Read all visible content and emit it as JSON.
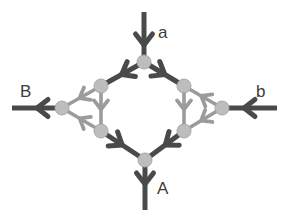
{
  "diagram": {
    "canvas": {
      "width": 286,
      "height": 220,
      "background": "#ffffff"
    },
    "colors": {
      "edge_dark": "#4a4a4a",
      "edge_light": "#9b9b9b",
      "node_fill": "#bdbdbd",
      "node_stroke": "#a8a8a8",
      "label_text": "#3c3c3c"
    },
    "labels": [
      {
        "id": "label-a",
        "text": "a",
        "x": 158,
        "y": 24,
        "role": "input-top"
      },
      {
        "id": "label-b",
        "text": "b",
        "x": 256,
        "y": 83,
        "role": "input-right"
      },
      {
        "id": "label-B",
        "text": "B",
        "x": 20,
        "y": 83,
        "role": "output-left"
      },
      {
        "id": "label-A",
        "text": "A",
        "x": 157,
        "y": 180,
        "role": "output-bottom"
      }
    ],
    "nodes": [
      {
        "id": "n-top",
        "x": 144,
        "y": 62,
        "r": 7
      },
      {
        "id": "n-upper-left",
        "x": 101,
        "y": 86,
        "r": 7
      },
      {
        "id": "n-upper-right",
        "x": 184,
        "y": 86,
        "r": 7
      },
      {
        "id": "n-left",
        "x": 62,
        "y": 108,
        "r": 7
      },
      {
        "id": "n-right",
        "x": 222,
        "y": 108,
        "r": 7
      },
      {
        "id": "n-lower-left",
        "x": 101,
        "y": 131,
        "r": 7
      },
      {
        "id": "n-lower-right",
        "x": 184,
        "y": 131,
        "r": 7
      },
      {
        "id": "n-bottom",
        "x": 145,
        "y": 160,
        "r": 7
      }
    ],
    "edges": [
      {
        "id": "e-in-a",
        "from": "external-top",
        "to": "n-top",
        "x1": 144,
        "y1": 12,
        "x2": 144,
        "y2": 62,
        "shade": "dark",
        "arrow_at": 0.66
      },
      {
        "id": "e-out-A",
        "from": "n-bottom",
        "to": "external-bot",
        "x1": 145,
        "y1": 160,
        "x2": 145,
        "y2": 210,
        "shade": "dark",
        "arrow_at": 0.48
      },
      {
        "id": "e-out-B",
        "from": "n-left",
        "to": "external-lft",
        "x1": 62,
        "y1": 108,
        "x2": 12,
        "y2": 108,
        "shade": "dark",
        "arrow_at": 0.5
      },
      {
        "id": "e-in-b",
        "from": "external-rgt",
        "to": "n-right",
        "x1": 277,
        "y1": 108,
        "x2": 222,
        "y2": 108,
        "shade": "dark",
        "arrow_at": 0.6
      },
      {
        "id": "e-top-ul",
        "from": "n-top",
        "to": "n-upper-left",
        "x1": 144,
        "y1": 62,
        "x2": 101,
        "y2": 86,
        "shade": "dark",
        "arrow_at": 0.52
      },
      {
        "id": "e-top-ur",
        "from": "n-top",
        "to": "n-upper-right",
        "x1": 144,
        "y1": 62,
        "x2": 184,
        "y2": 86,
        "shade": "dark",
        "arrow_at": 0.52
      },
      {
        "id": "e-ll-bot",
        "from": "n-lower-left",
        "to": "n-bottom",
        "x1": 101,
        "y1": 131,
        "x2": 145,
        "y2": 160,
        "shade": "dark",
        "arrow_at": 0.48
      },
      {
        "id": "e-lr-bot",
        "from": "n-lower-right",
        "to": "n-bottom",
        "x1": 184,
        "y1": 131,
        "x2": 145,
        "y2": 160,
        "shade": "dark",
        "arrow_at": 0.48
      },
      {
        "id": "e-ul-ll",
        "from": "n-upper-left",
        "to": "n-lower-left",
        "x1": 101,
        "y1": 86,
        "x2": 101,
        "y2": 131,
        "shade": "light",
        "arrow_at": 0.52
      },
      {
        "id": "e-ur-lr",
        "from": "n-upper-right",
        "to": "n-lower-right",
        "x1": 184,
        "y1": 86,
        "x2": 184,
        "y2": 131,
        "shade": "light",
        "arrow_at": 0.52
      },
      {
        "id": "e-ul-left",
        "from": "n-upper-left",
        "to": "n-left",
        "x1": 101,
        "y1": 86,
        "x2": 62,
        "y2": 108,
        "shade": "light",
        "arrow_at": 0.55
      },
      {
        "id": "e-ll-left",
        "from": "n-lower-left",
        "to": "n-left",
        "x1": 101,
        "y1": 131,
        "x2": 62,
        "y2": 108,
        "shade": "light",
        "arrow_at": 0.55
      },
      {
        "id": "e-right-ur",
        "from": "n-right",
        "to": "n-upper-right",
        "x1": 222,
        "y1": 108,
        "x2": 184,
        "y2": 86,
        "shade": "light",
        "arrow_at": 0.55
      },
      {
        "id": "e-right-lr",
        "from": "n-right",
        "to": "n-lower-right",
        "x1": 222,
        "y1": 108,
        "x2": 184,
        "y2": 131,
        "shade": "light",
        "arrow_at": 0.55
      }
    ]
  }
}
